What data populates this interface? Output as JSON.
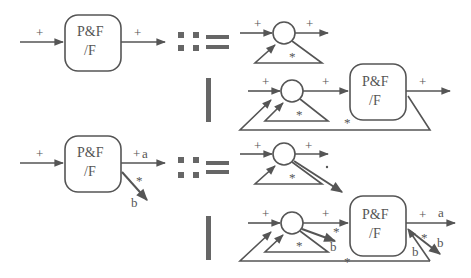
{
  "diagram": {
    "type": "grammar-production-rules",
    "colors": {
      "stroke": "#555555",
      "symbol": "#666666",
      "background": "#ffffff"
    },
    "rules": [
      {
        "lhs": {
          "box_label_line1": "P&F",
          "box_label_line2": "/F",
          "input_label": "+",
          "output_label": "+"
        },
        "define_symbol": "::=",
        "alternatives": [
          {
            "description": "circle with self loop",
            "input_label": "+",
            "output_label": "+",
            "loop_label": "*"
          },
          {
            "description": "circle with self loop feeding P&F/F box with outer loop",
            "input_label": "+",
            "mid_label": "+",
            "box_label_line1": "P&F",
            "box_label_line2": "/F",
            "output_label": "+",
            "inner_loop_label": "*",
            "outer_loop_label": "*"
          }
        ],
        "alt_separator": "|"
      },
      {
        "lhs": {
          "box_label_line1": "P&F",
          "box_label_line2": "/F",
          "input_label": "+",
          "output_label": "+",
          "output_port": "a",
          "branch_label": "*",
          "branch_port": "b"
        },
        "define_symbol": "::=",
        "alternatives": [
          {
            "description": "circle with self loop and branch",
            "input_label": "+",
            "output_label": "+",
            "loop_label": "*",
            "branch_label": "*"
          },
          {
            "description": "circle with self loop and branch feeding P&F/F box with outer loop and branches",
            "input_label": "+",
            "mid_label": "+",
            "circle_branch_label": "*",
            "circle_branch_port": "b",
            "box_label_line1": "P&F",
            "box_label_line2": "/F",
            "output_label": "+",
            "output_port": "a",
            "box_branch_label": "*",
            "box_branch_port": "b",
            "inner_loop_label": "*",
            "outer_loop_label": "*",
            "outer_loop_port": "b"
          }
        ],
        "alt_separator": "|"
      }
    ]
  }
}
